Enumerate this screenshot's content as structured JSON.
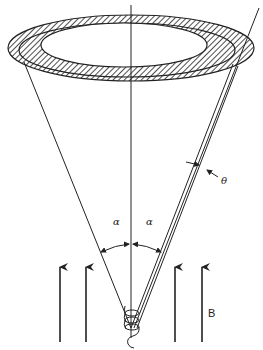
{
  "diagram": {
    "labels": {
      "alpha_left": "α",
      "alpha_right": "α",
      "theta": "θ",
      "field": "B"
    },
    "elements": [
      "annular-detector-ring (hatched, two bands)",
      "vertical-axis",
      "cone-boundary-left",
      "cone-boundary-right",
      "deflected-trajectory (double line)",
      "alpha-angle-arc",
      "theta-angle-marker",
      "magnetic-field-arrows (4)",
      "helical-source-path"
    ],
    "colors": {
      "ink": "#222222",
      "background": "#ffffff"
    }
  }
}
